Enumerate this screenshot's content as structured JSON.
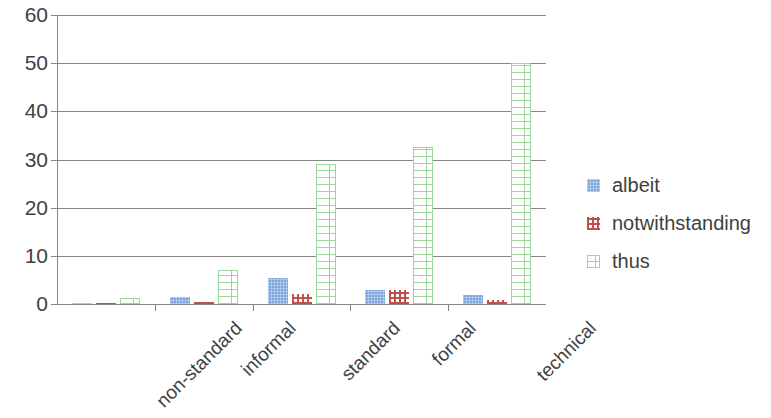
{
  "chart_data": {
    "type": "bar",
    "title": "",
    "subtitle": "",
    "xlabel": "",
    "ylabel": "",
    "categories": [
      "non-standard",
      "informal",
      "standard",
      "formal",
      "technical"
    ],
    "series": [
      {
        "name": "albeit",
        "color": "#7ba7dd",
        "values": [
          0.3,
          1.5,
          5.4,
          3.0,
          1.8
        ]
      },
      {
        "name": "notwithstanding",
        "color": "#c0504d",
        "values": [
          0.1,
          0.4,
          2.0,
          2.9,
          0.8
        ]
      },
      {
        "name": "thus",
        "color": "#9bd69b",
        "values": [
          1.3,
          7.0,
          29.0,
          32.5,
          50.0
        ]
      }
    ],
    "ylim": [
      0,
      60
    ],
    "yticks": [
      0,
      10,
      20,
      30,
      40,
      50,
      60
    ],
    "ytick_labels": [
      "0",
      "10",
      "20",
      "30",
      "40",
      "50",
      "60"
    ],
    "grid": true,
    "grid_axis": "y",
    "legend_position": "right",
    "legend_entries": [
      "albeit",
      "notwithstanding",
      "thus"
    ]
  },
  "axis": {
    "y_labels": [
      "60",
      "50",
      "40",
      "30",
      "20",
      "10",
      "0"
    ]
  },
  "legend": {
    "items": [
      {
        "label": "albeit"
      },
      {
        "label": "notwithstanding"
      },
      {
        "label": "thus"
      }
    ]
  }
}
